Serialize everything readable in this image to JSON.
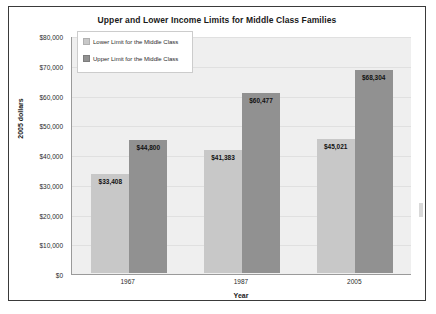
{
  "chart_data": {
    "type": "bar",
    "title": "Upper and Lower Income Limits for Middle Class Families",
    "xlabel": "Year",
    "ylabel": "2005 dollars",
    "categories": [
      "1967",
      "1987",
      "2005"
    ],
    "ylim": [
      0,
      80000
    ],
    "ytick_labels": [
      "$0",
      "$10,000",
      "$20,000",
      "$30,000",
      "$40,000",
      "$50,000",
      "$60,000",
      "$70,000",
      "$80,000"
    ],
    "ytick_values": [
      0,
      10000,
      20000,
      30000,
      40000,
      50000,
      60000,
      70000,
      80000
    ],
    "grid": true,
    "legend_position": "upper-left-inside",
    "series": [
      {
        "name": "Lower Limit for the Middle Class",
        "color": "#c8c8c8",
        "values": [
          33408,
          41383,
          45021
        ],
        "labels": [
          "$33,408",
          "$41,383",
          "$45,021"
        ]
      },
      {
        "name": "Upper Limit for the Middle Class",
        "color": "#919191",
        "values": [
          44800,
          60477,
          68304
        ],
        "labels": [
          "$44,800",
          "$60,477",
          "$68,304"
        ]
      }
    ]
  }
}
